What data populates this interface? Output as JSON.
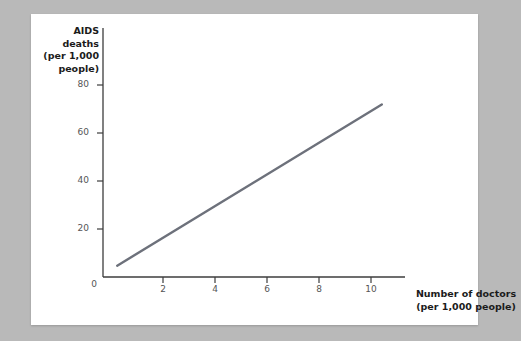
{
  "chart_data": {
    "type": "line",
    "title": "",
    "subtitle": "",
    "xlabel": "Number of doctors\n(per 1,000 people)",
    "ylabel": "AIDS\ndeaths\n(per 1,000\npeople)",
    "xlim": [
      0,
      11.7
    ],
    "ylim": [
      0,
      88
    ],
    "grid": false,
    "legend": null,
    "xticks": [
      0,
      2,
      4,
      6,
      8,
      10
    ],
    "xtick_labels": [
      "0",
      "2",
      "4",
      "6",
      "8",
      "10"
    ],
    "yticks": [
      0,
      20,
      40,
      60,
      80
    ],
    "ytick_labels": [
      "0",
      "20",
      "40",
      "60",
      "80"
    ],
    "origin_label": "0",
    "series": [
      {
        "name": "AIDS deaths vs doctors",
        "color": "#6d717b",
        "x": [
          0.55,
          10.8
        ],
        "y": [
          4,
          61
        ],
        "style": "solid",
        "width": 2.4
      }
    ],
    "annotations": []
  },
  "colors": {
    "page_background": "#b9b9b9",
    "card_background": "#ffffff",
    "axis": "#3c3c3c",
    "tick_text": "#555555",
    "label_text": "#1b1b1b",
    "line": "#6d717b"
  }
}
